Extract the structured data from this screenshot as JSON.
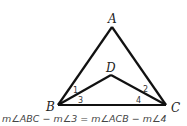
{
  "diagram": {
    "points": {
      "A": "A",
      "B": "B",
      "C": "C",
      "D": "D"
    },
    "angles": {
      "a1": "1",
      "a2": "2",
      "a3": "3",
      "a4": "4"
    },
    "caption": "m∠ABC − m∠3 = m∠ACB − m∠4"
  }
}
